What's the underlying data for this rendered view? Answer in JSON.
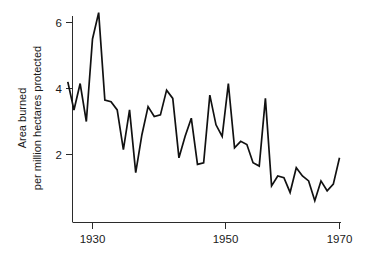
{
  "chart_data": {
    "type": "line",
    "title": "",
    "xlabel": "",
    "ylabel_line1": "Area burned",
    "ylabel_line2": "per million hectares protected",
    "xlim": [
      1925,
      1971
    ],
    "ylim": [
      0,
      6.6
    ],
    "xticks": [
      1930,
      1950,
      1970
    ],
    "xtick_labels": [
      "1930",
      "1950",
      "1970"
    ],
    "yticks": [
      2,
      4,
      6
    ],
    "ytick_labels": [
      "2",
      "4",
      "6"
    ],
    "grid": false,
    "legend": "none",
    "line_color": "#111111",
    "axis_color": "#2b2b2b",
    "background_color": "#ffffff",
    "x": [
      1926,
      1927,
      1928,
      1929,
      1930,
      1931,
      1932,
      1933,
      1934,
      1935,
      1936,
      1937,
      1938,
      1939,
      1940,
      1941,
      1942,
      1943,
      1944,
      1945,
      1946,
      1947,
      1948,
      1949,
      1950,
      1951,
      1952,
      1953,
      1954,
      1955,
      1956,
      1957,
      1958,
      1959,
      1960,
      1961,
      1962,
      1963,
      1964,
      1965,
      1966,
      1967,
      1968,
      1969,
      1970
    ],
    "values": [
      4.2,
      3.35,
      4.15,
      3.0,
      5.5,
      6.3,
      3.65,
      3.6,
      3.35,
      2.15,
      3.35,
      1.45,
      2.6,
      3.45,
      3.15,
      3.2,
      3.95,
      3.7,
      1.9,
      2.55,
      3.1,
      1.7,
      1.75,
      3.8,
      2.9,
      2.55,
      4.15,
      2.2,
      2.4,
      2.3,
      1.75,
      1.65,
      3.7,
      1.05,
      1.35,
      1.3,
      0.85,
      1.6,
      1.35,
      1.2,
      0.6,
      1.2,
      0.9,
      1.1,
      1.9
    ],
    "series_name": "Area burned per million hectares protected",
    "annotations": []
  }
}
